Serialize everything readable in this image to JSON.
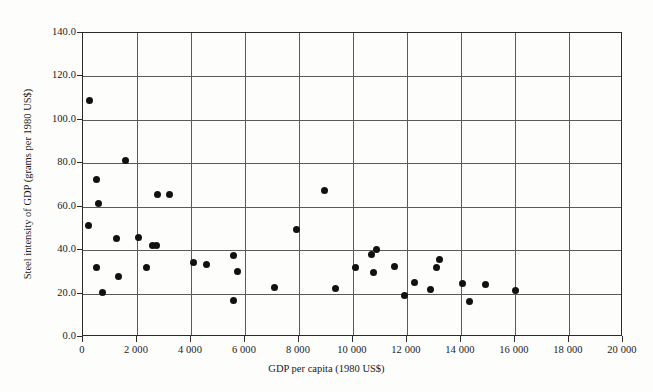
{
  "chart_data": {
    "type": "scatter",
    "title": "",
    "xlabel": "GDP per capita (1980 US$)",
    "ylabel": "Steel intensity of GDP (grams per 1980 US$)",
    "xlim": [
      0,
      20000
    ],
    "ylim": [
      0,
      140
    ],
    "xticks": [
      0,
      2000,
      4000,
      6000,
      8000,
      10000,
      12000,
      14000,
      16000,
      18000,
      20000
    ],
    "xtick_labels": [
      "0",
      "2 000",
      "4 000",
      "6 000",
      "8 000",
      "10 000",
      "12 000",
      "14 000",
      "16 000",
      "18 000",
      "20 000"
    ],
    "yticks": [
      0,
      20,
      40,
      60,
      80,
      100,
      120,
      140
    ],
    "ytick_labels": [
      "0.0",
      "20.0",
      "40.0",
      "60.0",
      "80.0",
      "100.0",
      "120.0",
      "140.0"
    ],
    "grid": true,
    "grid_axes": "both",
    "grid_x_interval": 2000,
    "grid_y_interval": 20,
    "legend": false,
    "marker": "filled-circle",
    "marker_color": "#111111",
    "marker_size": 7,
    "points": [
      {
        "x": 230,
        "y": 109.0
      },
      {
        "x": 1580,
        "y": 81.5
      },
      {
        "x": 490,
        "y": 72.7
      },
      {
        "x": 580,
        "y": 61.5
      },
      {
        "x": 2770,
        "y": 65.8
      },
      {
        "x": 3200,
        "y": 65.8
      },
      {
        "x": 220,
        "y": 51.5
      },
      {
        "x": 1230,
        "y": 45.5
      },
      {
        "x": 2040,
        "y": 46.0
      },
      {
        "x": 2580,
        "y": 42.0
      },
      {
        "x": 2730,
        "y": 42.0
      },
      {
        "x": 490,
        "y": 32.0
      },
      {
        "x": 2370,
        "y": 32.0
      },
      {
        "x": 1320,
        "y": 27.8
      },
      {
        "x": 740,
        "y": 20.5
      },
      {
        "x": 4100,
        "y": 34.5
      },
      {
        "x": 4570,
        "y": 33.5
      },
      {
        "x": 5570,
        "y": 37.5
      },
      {
        "x": 5740,
        "y": 30.0
      },
      {
        "x": 5590,
        "y": 16.8
      },
      {
        "x": 7090,
        "y": 23.0
      },
      {
        "x": 7920,
        "y": 49.5
      },
      {
        "x": 8960,
        "y": 67.3
      },
      {
        "x": 9370,
        "y": 22.3
      },
      {
        "x": 10110,
        "y": 32.0
      },
      {
        "x": 10670,
        "y": 38.0
      },
      {
        "x": 10880,
        "y": 40.5
      },
      {
        "x": 10750,
        "y": 29.5
      },
      {
        "x": 11540,
        "y": 32.5
      },
      {
        "x": 11890,
        "y": 19.0
      },
      {
        "x": 12260,
        "y": 25.0
      },
      {
        "x": 12860,
        "y": 22.0
      },
      {
        "x": 13100,
        "y": 32.0
      },
      {
        "x": 13200,
        "y": 35.8
      },
      {
        "x": 14050,
        "y": 24.5
      },
      {
        "x": 14310,
        "y": 16.5
      },
      {
        "x": 14900,
        "y": 24.0
      },
      {
        "x": 16000,
        "y": 21.5
      }
    ]
  }
}
